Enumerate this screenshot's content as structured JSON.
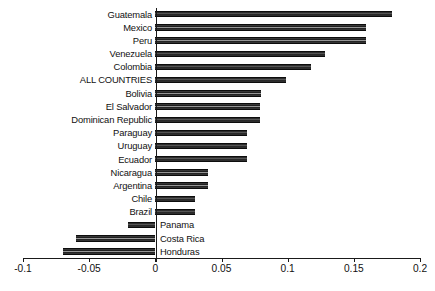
{
  "chart_data": {
    "type": "bar",
    "orientation": "horizontal",
    "title": "",
    "subtitle": "",
    "xlabel": "",
    "ylabel": "",
    "xlim": [
      -0.1,
      0.2
    ],
    "grid": false,
    "legend": null,
    "xticks": [
      -0.1,
      -0.05,
      0,
      0.05,
      0.1,
      0.15,
      0.2
    ],
    "xticklabels": [
      "-0.1",
      "-0.05",
      "0",
      "0.05",
      "0.1",
      "0.15",
      "0.2"
    ],
    "categories": [
      "Guatemala",
      "Mexico",
      "Peru",
      "Venezuela",
      "Colombia",
      "ALL COUNTRIES",
      "Bolivia",
      "El Salvador",
      "Dominican Republic",
      "Paraguay",
      "Uruguay",
      "Ecuador",
      "Nicaragua",
      "Argentina",
      "Chile",
      "Brazil",
      "Panama",
      "Costa Rica",
      "Honduras"
    ],
    "values": [
      0.179,
      0.159,
      0.159,
      0.128,
      0.118,
      0.099,
      0.08,
      0.079,
      0.079,
      0.069,
      0.069,
      0.069,
      0.04,
      0.04,
      0.03,
      0.03,
      -0.021,
      -0.06,
      -0.07
    ],
    "bar_color": "#262626",
    "axis_color": "#1a1a1a",
    "background_color": "#ffffff"
  }
}
